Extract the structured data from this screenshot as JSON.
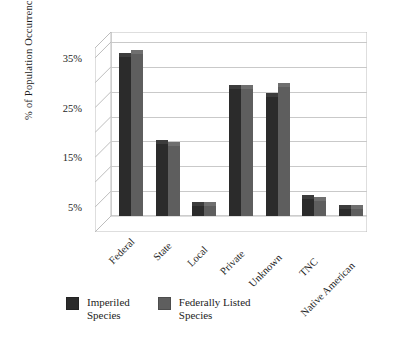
{
  "chart_data": {
    "type": "bar",
    "title": "",
    "xlabel": "",
    "ylabel": "% of Population Occurrences",
    "categories": [
      "Federal",
      "State",
      "Local",
      "Private",
      "Unknown",
      "TNC",
      "Native American"
    ],
    "series": [
      {
        "name": "Imperiled Species",
        "color": "#2b2b2b",
        "values": [
          32,
          14.5,
          2,
          25.5,
          24,
          3.5,
          1.5
        ]
      },
      {
        "name": "Federally Listed Species",
        "color": "#5e5e5e",
        "values": [
          32.5,
          14,
          2,
          25.5,
          26,
          3,
          1.5
        ]
      }
    ],
    "ylim": [
      0,
      37
    ],
    "ytick_values": [
      5,
      15,
      25,
      35
    ],
    "ytick_labels": [
      "5%",
      "15%",
      "25%",
      "35%"
    ],
    "yminor_values": [
      10,
      20,
      30
    ],
    "gridlines": true,
    "grid_values": [
      5,
      10,
      15,
      20,
      25,
      30,
      35
    ],
    "legend_position": "bottom-left",
    "style_3d": true
  },
  "legend": {
    "items": [
      {
        "label": "Imperiled\nSpecies",
        "color_key": "s0"
      },
      {
        "label": "Federally Listed\nSpecies",
        "color_key": "s1"
      }
    ]
  }
}
